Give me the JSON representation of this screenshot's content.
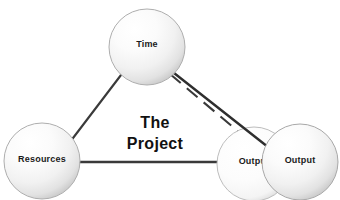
{
  "diagram": {
    "title_text": {
      "line1": "The",
      "line2": "Project"
    },
    "background_color": "#ffffff",
    "line_color": "#3a3a3a",
    "text_color": "#1a1a1a",
    "sphere_fill_light": "#ffffff",
    "sphere_fill_mid": "#f2f2f2",
    "sphere_fill_edge": "#c9c9c9",
    "sphere_stroke": "#b0b0b0",
    "nodes": [
      {
        "id": "time",
        "label": "Time",
        "cx": 147,
        "cy": 47,
        "r": 38
      },
      {
        "id": "resources",
        "label": "Resources",
        "cx": 42,
        "cy": 161,
        "r": 38
      },
      {
        "id": "output-back",
        "label": "Output",
        "cx": 254,
        "cy": 164,
        "r": 37
      },
      {
        "id": "output-front",
        "label": "Output",
        "cx": 300,
        "cy": 162,
        "r": 38
      }
    ],
    "connections": [
      {
        "id": "time-resources",
        "style": "solid",
        "from": "time",
        "to": "resources",
        "x1": 121,
        "y1": 75,
        "x2": 70,
        "y2": 142
      },
      {
        "id": "resources-output",
        "style": "solid",
        "from": "resources",
        "to": "output-back",
        "x1": 79,
        "y1": 162,
        "x2": 222,
        "y2": 162
      },
      {
        "id": "time-output-front",
        "style": "solid",
        "from": "time",
        "to": "output-front",
        "x1": 174,
        "y1": 73,
        "x2": 267,
        "y2": 146
      },
      {
        "id": "time-output-back",
        "style": "dashed",
        "from": "time",
        "to": "output-back",
        "x1": 170,
        "y1": 74,
        "x2": 238,
        "y2": 131
      }
    ]
  }
}
